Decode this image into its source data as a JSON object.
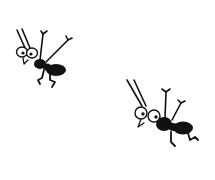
{
  "scene": {
    "description": "Two cartoon ants doing a cheerful jump",
    "background": "#ffffff",
    "ink_color": "#111111"
  },
  "figures": [
    {
      "name": "ant-left",
      "pose": "jumping, arms raised"
    },
    {
      "name": "ant-right",
      "pose": "jumping, arms raised"
    }
  ]
}
